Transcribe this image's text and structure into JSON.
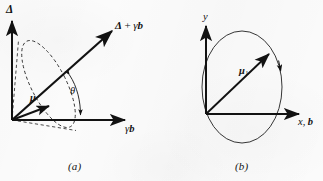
{
  "figure": {
    "kind": "physics-vector-diagram",
    "background_color": "#fbfbfb",
    "ink_color": "#121212",
    "width": 323,
    "height": 181
  },
  "panel_a": {
    "caption": "(a)",
    "vertical_axis_label": "Δ",
    "horizontal_axis_label_greek": "γ",
    "horizontal_axis_label_bold": "b",
    "resultant_label_delta": "Δ",
    "resultant_label_plus": "+",
    "resultant_label_gamma": "γ",
    "resultant_label_b": "b",
    "moment_label": "μ",
    "angle_label": "θ",
    "cone_style": "dashed",
    "elements": [
      "vertical-axis-arrow",
      "horizontal-axis-arrow",
      "resultant-vector-arrow",
      "magnetic-moment-arrow",
      "precession-cone-ellipse",
      "precession-cone-generator-lines",
      "angle-arc-double-arrow"
    ]
  },
  "panel_b": {
    "caption": "(b)",
    "vertical_axis_label": "y",
    "horizontal_axis_label_x": "x,",
    "horizontal_axis_label_b": "b",
    "moment_label_base": "μ",
    "moment_label_subscript": "1",
    "orbit_style": "solid",
    "orbit_direction": "clockwise",
    "elements": [
      "vertical-axis-arrow",
      "horizontal-axis-arrow",
      "moment-vector-arrow",
      "precession-orbit-ellipse",
      "orbit-direction-arrowhead"
    ]
  }
}
